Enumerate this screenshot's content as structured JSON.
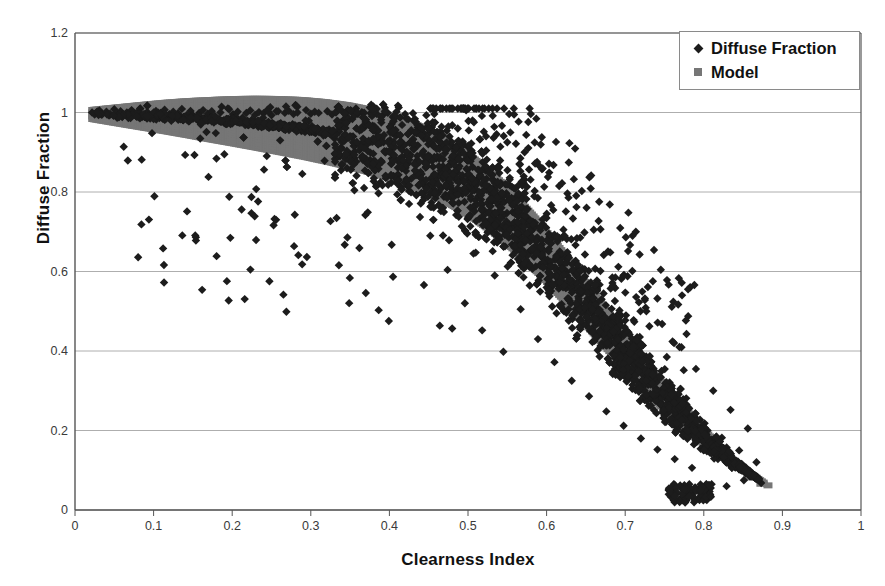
{
  "chart_data": {
    "type": "scatter",
    "title": "",
    "xlabel": "Clearness Index",
    "ylabel": "Diffuse Fraction",
    "xlim": [
      0,
      1
    ],
    "ylim": [
      0,
      1.2
    ],
    "xticks": [
      "0",
      "0.1",
      "0.2",
      "0.3",
      "0.4",
      "0.5",
      "0.6",
      "0.7",
      "0.8",
      "0.9",
      "1"
    ],
    "yticks": [
      "0",
      "0.2",
      "0.4",
      "0.6",
      "0.8",
      "1",
      "1.2"
    ],
    "grid": "horizontal",
    "legend_position": "top-right",
    "series": [
      {
        "name": "Diffuse Fraction",
        "marker": "diamond",
        "color": "#1c1c1c",
        "description": "Measured hourly diffuse fraction values scattered about the model curve with substantial vertical spread, densest between clearness index 0.45 and 0.80.",
        "points": [
          [
            0.025,
            0.995
          ],
          [
            0.031,
            1.005
          ],
          [
            0.034,
            0.998
          ],
          [
            0.04,
            1.002
          ],
          [
            0.044,
            0.993
          ],
          [
            0.05,
            1.008
          ],
          [
            0.053,
            0.999
          ],
          [
            0.058,
            1.003
          ],
          [
            0.062,
            0.914
          ],
          [
            0.066,
            1.0
          ],
          [
            0.072,
            1.006
          ],
          [
            0.078,
            0.998
          ],
          [
            0.083,
            1.01
          ],
          [
            0.088,
            0.996
          ],
          [
            0.092,
            1.001
          ],
          [
            0.098,
            0.948
          ],
          [
            0.103,
            1.004
          ],
          [
            0.109,
            0.999
          ],
          [
            0.114,
            1.007
          ],
          [
            0.12,
            0.996
          ],
          [
            0.125,
            1.002
          ],
          [
            0.131,
            0.998
          ],
          [
            0.136,
            1.009
          ],
          [
            0.142,
            0.993
          ],
          [
            0.147,
            1.004
          ],
          [
            0.152,
            0.893
          ],
          [
            0.158,
            0.999
          ],
          [
            0.163,
            1.006
          ],
          [
            0.169,
            0.997
          ],
          [
            0.174,
            1.003
          ],
          [
            0.18,
            0.884
          ],
          [
            0.185,
            1.0
          ],
          [
            0.19,
            0.895
          ],
          [
            0.196,
            1.008
          ],
          [
            0.201,
            0.996
          ],
          [
            0.207,
            1.002
          ],
          [
            0.212,
            0.756
          ],
          [
            0.218,
            0.999
          ],
          [
            0.223,
            1.005
          ],
          [
            0.229,
            0.994
          ],
          [
            0.234,
            1.001
          ],
          [
            0.24,
            0.998
          ],
          [
            0.245,
            1.007
          ],
          [
            0.25,
            0.993
          ],
          [
            0.256,
            1.003
          ],
          [
            0.261,
            0.93
          ],
          [
            0.267,
            0.999
          ],
          [
            0.272,
            1.004
          ],
          [
            0.278,
            0.996
          ],
          [
            0.283,
            1.0
          ],
          [
            0.289,
            0.618
          ],
          [
            0.294,
            1.006
          ],
          [
            0.3,
            0.997
          ],
          [
            0.305,
            1.002
          ],
          [
            0.31,
            0.999
          ],
          [
            0.316,
            0.942
          ],
          [
            0.321,
            1.003
          ],
          [
            0.327,
            0.995
          ],
          [
            0.332,
            1.0
          ],
          [
            0.338,
            0.931
          ],
          [
            0.343,
            0.998
          ],
          [
            0.349,
            1.004
          ],
          [
            0.354,
            0.872
          ],
          [
            0.36,
            0.996
          ],
          [
            0.365,
            1.001
          ],
          [
            0.37,
            0.546
          ],
          [
            0.376,
            0.998
          ],
          [
            0.381,
            1.003
          ],
          [
            0.387,
            0.935
          ],
          [
            0.392,
            0.994
          ],
          [
            0.398,
            0.999
          ],
          [
            0.403,
            0.884
          ],
          [
            0.409,
            1.002
          ],
          [
            0.414,
            0.911
          ],
          [
            0.42,
            0.996
          ],
          [
            0.425,
            0.77
          ],
          [
            0.43,
            0.998
          ],
          [
            0.436,
            0.962
          ],
          [
            0.441,
            0.845
          ],
          [
            0.447,
            0.993
          ],
          [
            0.452,
            0.69
          ],
          [
            0.458,
            0.975
          ],
          [
            0.463,
            0.8
          ],
          [
            0.469,
            0.918
          ],
          [
            0.474,
            0.604
          ],
          [
            0.48,
            0.968
          ],
          [
            0.485,
            0.742
          ],
          [
            0.49,
            0.88
          ],
          [
            0.496,
            0.52
          ],
          [
            0.501,
            0.955
          ],
          [
            0.507,
            0.645
          ],
          [
            0.512,
            0.832
          ],
          [
            0.518,
            0.452
          ],
          [
            0.523,
            0.94
          ],
          [
            0.529,
            0.71
          ],
          [
            0.534,
            0.59
          ],
          [
            0.54,
            0.862
          ],
          [
            0.545,
            0.398
          ],
          [
            0.55,
            0.925
          ],
          [
            0.556,
            0.668
          ],
          [
            0.561,
            0.78
          ],
          [
            0.567,
            0.505
          ],
          [
            0.572,
            0.9
          ],
          [
            0.578,
            0.612
          ],
          [
            0.583,
            0.722
          ],
          [
            0.589,
            0.43
          ],
          [
            0.594,
            0.858
          ],
          [
            0.6,
            0.56
          ],
          [
            0.605,
            0.68
          ],
          [
            0.61,
            0.372
          ],
          [
            0.616,
            0.815
          ],
          [
            0.621,
            0.505
          ],
          [
            0.627,
            0.64
          ],
          [
            0.632,
            0.325
          ],
          [
            0.638,
            0.762
          ],
          [
            0.643,
            0.455
          ],
          [
            0.649,
            0.588
          ],
          [
            0.654,
            0.286
          ],
          [
            0.66,
            0.705
          ],
          [
            0.665,
            0.402
          ],
          [
            0.67,
            0.53
          ],
          [
            0.676,
            0.248
          ],
          [
            0.681,
            0.648
          ],
          [
            0.687,
            0.355
          ],
          [
            0.692,
            0.47
          ],
          [
            0.698,
            0.212
          ],
          [
            0.703,
            0.588
          ],
          [
            0.709,
            0.305
          ],
          [
            0.714,
            0.412
          ],
          [
            0.72,
            0.18
          ],
          [
            0.725,
            0.528
          ],
          [
            0.73,
            0.262
          ],
          [
            0.736,
            0.356
          ],
          [
            0.741,
            0.152
          ],
          [
            0.747,
            0.468
          ],
          [
            0.752,
            0.222
          ],
          [
            0.758,
            0.305
          ],
          [
            0.763,
            0.128
          ],
          [
            0.769,
            0.41
          ],
          [
            0.774,
            0.186
          ],
          [
            0.78,
            0.258
          ],
          [
            0.785,
            0.106
          ],
          [
            0.79,
            0.355
          ],
          [
            0.796,
            0.154
          ],
          [
            0.801,
            0.218
          ],
          [
            0.807,
            0.04
          ],
          [
            0.812,
            0.3
          ],
          [
            0.818,
            0.128
          ],
          [
            0.823,
            0.182
          ],
          [
            0.829,
            0.06
          ],
          [
            0.834,
            0.252
          ],
          [
            0.84,
            0.108
          ],
          [
            0.845,
            0.15
          ],
          [
            0.851,
            0.075
          ],
          [
            0.856,
            0.205
          ],
          [
            0.862,
            0.092
          ],
          [
            0.867,
            0.12
          ],
          [
            0.873,
            0.068
          ]
        ]
      },
      {
        "name": "Model",
        "marker": "square",
        "color": "#767676",
        "description": "Fitted sigmoid model band decaying from a diffuse fraction near 1.0 at low clearness index to about 0.06 at clearness index 0.88.",
        "curve": [
          [
            0.02,
            0.995
          ],
          [
            0.05,
            0.993
          ],
          [
            0.08,
            0.991
          ],
          [
            0.11,
            0.989
          ],
          [
            0.14,
            0.986
          ],
          [
            0.17,
            0.982
          ],
          [
            0.2,
            0.978
          ],
          [
            0.23,
            0.973
          ],
          [
            0.26,
            0.967
          ],
          [
            0.29,
            0.96
          ],
          [
            0.32,
            0.951
          ],
          [
            0.35,
            0.94
          ],
          [
            0.38,
            0.926
          ],
          [
            0.41,
            0.908
          ],
          [
            0.44,
            0.885
          ],
          [
            0.47,
            0.856
          ],
          [
            0.5,
            0.82
          ],
          [
            0.53,
            0.775
          ],
          [
            0.56,
            0.722
          ],
          [
            0.59,
            0.66
          ],
          [
            0.62,
            0.592
          ],
          [
            0.65,
            0.52
          ],
          [
            0.68,
            0.446
          ],
          [
            0.71,
            0.374
          ],
          [
            0.74,
            0.305
          ],
          [
            0.77,
            0.242
          ],
          [
            0.8,
            0.185
          ],
          [
            0.82,
            0.15
          ],
          [
            0.84,
            0.118
          ],
          [
            0.86,
            0.09
          ],
          [
            0.88,
            0.065
          ]
        ],
        "band_halfwidth": 0.045
      }
    ]
  },
  "legend": {
    "entries": [
      {
        "label": "Diffuse Fraction",
        "marker": "diamond-marker-icon"
      },
      {
        "label": "Model",
        "marker": "square-marker-icon"
      }
    ]
  },
  "colors": {
    "data_marker": "#1c1c1c",
    "model_marker": "#767676",
    "gridline": "#aeaeae",
    "axis": "#555555",
    "background": "#ffffff"
  }
}
